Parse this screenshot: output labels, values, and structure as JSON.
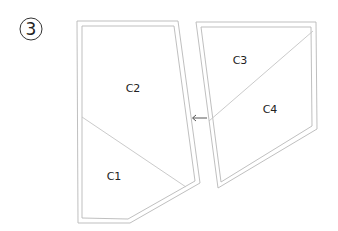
{
  "step": {
    "number": "3"
  },
  "shapes": [
    {
      "name": "left-polygon",
      "regions": [
        {
          "label": "C2"
        },
        {
          "label": "C1"
        }
      ]
    },
    {
      "name": "right-polygon",
      "regions": [
        {
          "label": "C3"
        },
        {
          "label": "C4"
        }
      ]
    }
  ],
  "arrow": {
    "direction": "left",
    "glyph": "←"
  },
  "colors": {
    "line": "#b8b8b8",
    "text": "#222222"
  }
}
